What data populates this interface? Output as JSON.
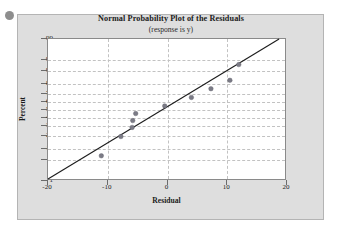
{
  "figure": {
    "corner_dot": "bullet-marker"
  },
  "chart_data": {
    "type": "scatter",
    "title": "Normal Probability Plot of the Residuals",
    "subtitle": "(response is y)",
    "xlabel": "Residual",
    "ylabel": "Percent",
    "xlim": [
      -20,
      20
    ],
    "ylim": [
      1,
      99
    ],
    "grid": true,
    "legend": null,
    "y_scale": "normal-probability",
    "xticks": [
      -20,
      -10,
      0,
      10,
      20
    ],
    "xtick_labels": [
      "-20",
      "-10",
      "0",
      "10",
      "20"
    ],
    "yticks": [
      1,
      5,
      10,
      20,
      30,
      40,
      50,
      60,
      70,
      80,
      90,
      95,
      99
    ],
    "ytick_labels": [
      "1",
      "5",
      "10",
      "20",
      "30",
      "40",
      "50",
      "60",
      "70",
      "80",
      "90",
      "95",
      "99"
    ],
    "points": [
      {
        "x": -11.0,
        "y": 6
      },
      {
        "x": -7.7,
        "y": 18
      },
      {
        "x": -5.8,
        "y": 27
      },
      {
        "x": -5.7,
        "y": 35
      },
      {
        "x": -5.2,
        "y": 44
      },
      {
        "x": -0.3,
        "y": 54
      },
      {
        "x": 4.2,
        "y": 65
      },
      {
        "x": 7.5,
        "y": 75
      },
      {
        "x": 10.7,
        "y": 83
      },
      {
        "x": 12.2,
        "y": 93
      }
    ],
    "reference_line": {
      "x1": -20.0,
      "y1": 1,
      "x2": 19.0,
      "y2": 99
    },
    "marker_color": "#7b7b86",
    "line_color": "#1d1d1d",
    "grid_color": "#c2c2c2",
    "plot_bg": "#ffffff",
    "figure_bg": "#dedede"
  }
}
